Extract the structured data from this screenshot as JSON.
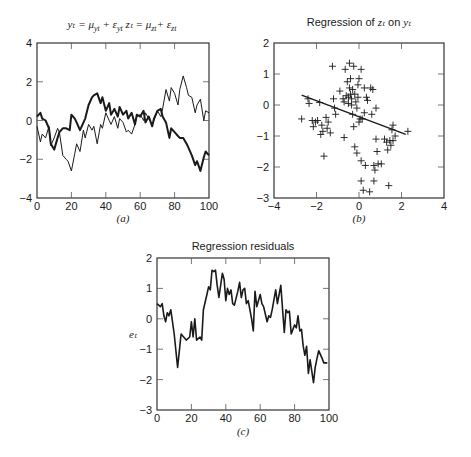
{
  "chart_data": [
    {
      "id": "a",
      "type": "line",
      "title": "y_t = μ_yt + ε_yt  z_t = μ_zt + ε_zt",
      "title_parts": {
        "y": "yₜ = μ",
        "ysub": "yt",
        "ymid": " + ε",
        "ysub2": "yt",
        "z": "  zₜ = μ",
        "zsub": "zt",
        "zmid": "+ ε",
        "zsub2": "zt"
      },
      "panel_label": "(a)",
      "xlabel": "",
      "ylabel": "",
      "xlim": [
        0,
        100
      ],
      "ylim": [
        -4,
        4
      ],
      "xticks": [
        "0",
        "20",
        "40",
        "60",
        "80",
        "100"
      ],
      "yticks": [
        "4",
        "2",
        "0",
        "−2",
        "−4"
      ],
      "grid": false,
      "series": [
        {
          "name": "y_t (thick)",
          "stroke_width": 2,
          "x": [
            0,
            2,
            3,
            5,
            7,
            8,
            10,
            12,
            13,
            15,
            17,
            19,
            20,
            22,
            23,
            25,
            26,
            28,
            30,
            32,
            33,
            35,
            37,
            38,
            40,
            42,
            43,
            45,
            47,
            48,
            50,
            52,
            53,
            55,
            57,
            58,
            60,
            62,
            63,
            65,
            67,
            68,
            70,
            72,
            73,
            75,
            77,
            78,
            80,
            82,
            83,
            85,
            87,
            88,
            90,
            92,
            93,
            95,
            97,
            98,
            100
          ],
          "values": [
            0.2,
            0.4,
            0.1,
            0.0,
            -0.4,
            -1.2,
            -1.5,
            -0.9,
            -0.6,
            -0.4,
            -0.4,
            -0.5,
            0.3,
            0.1,
            -0.1,
            -0.5,
            -0.3,
            0.1,
            0.8,
            1.2,
            1.3,
            1.4,
            0.9,
            1.2,
            0.5,
            0.9,
            0.3,
            0.6,
            0.2,
            0.7,
            0.3,
            0.5,
            0.1,
            0.4,
            -0.2,
            0.3,
            0.2,
            0.5,
            -0.1,
            0.2,
            -0.3,
            0.1,
            0.5,
            0.6,
            0.2,
            -0.1,
            -0.9,
            -0.4,
            -0.6,
            -0.8,
            -0.9,
            -0.9,
            -1.2,
            -1.4,
            -1.8,
            -2.3,
            -2.1,
            -2.6,
            -1.9,
            -1.6,
            -1.8
          ]
        },
        {
          "name": "z_t (thin)",
          "stroke_width": 1,
          "x": [
            0,
            2,
            3,
            5,
            7,
            8,
            10,
            12,
            13,
            15,
            17,
            18,
            20,
            22,
            23,
            25,
            27,
            28,
            30,
            32,
            33,
            35,
            37,
            38,
            40,
            42,
            43,
            45,
            47,
            48,
            50,
            52,
            53,
            55,
            57,
            58,
            60,
            62,
            63,
            65,
            67,
            68,
            70,
            72,
            73,
            75,
            77,
            78,
            80,
            82,
            83,
            85,
            87,
            88,
            90,
            92,
            93,
            95,
            97,
            98,
            100
          ],
          "values": [
            -0.3,
            -1.1,
            -0.7,
            -0.9,
            -0.3,
            -1.3,
            -0.9,
            -0.4,
            -0.6,
            -1.8,
            -2.0,
            -2.1,
            -2.6,
            -1.7,
            -1.2,
            -1.6,
            -0.5,
            -0.9,
            -0.2,
            -0.5,
            -0.3,
            -1.2,
            -0.2,
            -0.4,
            0.4,
            0.0,
            -0.2,
            0.2,
            -0.4,
            0.1,
            -0.1,
            -0.6,
            -0.5,
            -0.7,
            -0.2,
            0.2,
            0.3,
            0.0,
            0.4,
            0.1,
            -0.2,
            0.0,
            0.5,
            0.2,
            0.6,
            1.6,
            1.0,
            1.7,
            1.4,
            0.8,
            1.6,
            2.3,
            1.7,
            1.3,
            1.2,
            0.4,
            0.8,
            1.1,
            0.0,
            0.5,
            0.4
          ]
        }
      ]
    },
    {
      "id": "b",
      "type": "scatter",
      "title": "Regression of z_t on y_t",
      "title_parts": {
        "prefix": "Regression of ",
        "z": "zₜ",
        "mid": " on ",
        "y": "yₜ"
      },
      "panel_label": "(b)",
      "xlim": [
        -4,
        4
      ],
      "ylim": [
        -3,
        2
      ],
      "xticks": [
        "−4",
        "−2",
        "0",
        "2",
        "4"
      ],
      "yticks": [
        "2",
        "1",
        "0",
        "−1",
        "−2",
        "−3"
      ],
      "grid": false,
      "marker": "+",
      "points": [
        [
          -2.7,
          -0.45
        ],
        [
          -2.4,
          0.2
        ],
        [
          -2.35,
          0.05
        ],
        [
          -2.2,
          -0.5
        ],
        [
          -2.15,
          -0.7
        ],
        [
          -2.05,
          -0.55
        ],
        [
          -1.95,
          -0.5
        ],
        [
          -1.85,
          0.08
        ],
        [
          -1.8,
          -0.95
        ],
        [
          -1.75,
          -0.65
        ],
        [
          -1.7,
          -0.85
        ],
        [
          -1.65,
          -1.65
        ],
        [
          -1.55,
          -0.4
        ],
        [
          -1.5,
          -0.75
        ],
        [
          -1.45,
          -0.55
        ],
        [
          -1.35,
          -0.9
        ],
        [
          -1.25,
          1.25
        ],
        [
          -1.2,
          0.2
        ],
        [
          -1.15,
          -0.1
        ],
        [
          -1.1,
          -0.3
        ],
        [
          -0.9,
          0.45
        ],
        [
          -0.75,
          0.2
        ],
        [
          -0.7,
          0.1
        ],
        [
          -0.7,
          -1.05
        ],
        [
          -0.65,
          1.15
        ],
        [
          -0.6,
          0.3
        ],
        [
          -0.55,
          0.75
        ],
        [
          -0.5,
          0.05
        ],
        [
          -0.5,
          0.25
        ],
        [
          -0.45,
          1.35
        ],
        [
          -0.45,
          0.55
        ],
        [
          -0.4,
          0.85
        ],
        [
          -0.4,
          0.35
        ],
        [
          -0.35,
          0.2
        ],
        [
          -0.35,
          0.0
        ],
        [
          -0.3,
          0.5
        ],
        [
          -0.3,
          -0.3
        ],
        [
          -0.25,
          1.25
        ],
        [
          -0.25,
          -0.7
        ],
        [
          -0.2,
          0.35
        ],
        [
          -0.2,
          -1.35
        ],
        [
          -0.15,
          0.1
        ],
        [
          -0.1,
          -0.1
        ],
        [
          -0.1,
          -1.55
        ],
        [
          -0.05,
          0.65
        ],
        [
          -0.05,
          0.25
        ],
        [
          0.0,
          0.85
        ],
        [
          0.0,
          -0.55
        ],
        [
          0.05,
          -0.45
        ],
        [
          0.1,
          1.15
        ],
        [
          0.1,
          -1.8
        ],
        [
          0.1,
          -2.45
        ],
        [
          0.15,
          -0.45
        ],
        [
          0.2,
          -2.75
        ],
        [
          0.25,
          0.55
        ],
        [
          0.25,
          -0.25
        ],
        [
          0.3,
          -1.95
        ],
        [
          0.35,
          0.25
        ],
        [
          0.4,
          0.15
        ],
        [
          0.5,
          -2.8
        ],
        [
          0.55,
          0.55
        ],
        [
          0.6,
          -0.3
        ],
        [
          0.65,
          0.5
        ],
        [
          0.7,
          -1.95
        ],
        [
          0.7,
          -2.45
        ],
        [
          0.75,
          -2.1
        ],
        [
          0.8,
          -0.1
        ],
        [
          0.8,
          -1.1
        ],
        [
          0.85,
          -1.5
        ],
        [
          0.9,
          -1.9
        ],
        [
          1.05,
          -1.9
        ],
        [
          1.2,
          -1.1
        ],
        [
          1.3,
          -1.2
        ],
        [
          1.35,
          -1.45
        ],
        [
          1.4,
          -2.6
        ],
        [
          1.45,
          -1.15
        ],
        [
          1.5,
          -1.3
        ],
        [
          1.55,
          -0.8
        ],
        [
          1.6,
          -0.65
        ],
        [
          1.6,
          -1.15
        ],
        [
          1.7,
          -1.0
        ],
        [
          2.3,
          -0.85
        ]
      ],
      "fit_line": {
        "x": [
          -2.7,
          2.2
        ],
        "y": [
          0.32,
          -0.95
        ]
      }
    },
    {
      "id": "c",
      "type": "line",
      "title": "Regression residuals",
      "panel_label": "(c)",
      "ylabel": "e_t",
      "ylabel_display": "eₜ",
      "xlim": [
        0,
        100
      ],
      "ylim": [
        -3,
        2
      ],
      "xticks": [
        "0",
        "20",
        "40",
        "60",
        "80",
        "100"
      ],
      "yticks": [
        "2",
        "1",
        "0",
        "−1",
        "−2",
        "−3"
      ],
      "grid": false,
      "series": [
        {
          "name": "e_t",
          "stroke_width": 1.6,
          "x": [
            0,
            2,
            3,
            4,
            5,
            6,
            7,
            8,
            10,
            12,
            14,
            17,
            19,
            20,
            21,
            22,
            23,
            25,
            26,
            27,
            29,
            30,
            31,
            32,
            33,
            34,
            35,
            36,
            38,
            39,
            40,
            41,
            42,
            43,
            44,
            45,
            47,
            48,
            49,
            50,
            51,
            52,
            53,
            55,
            56,
            57,
            58,
            60,
            61,
            62,
            64,
            65,
            66,
            67,
            69,
            70,
            71,
            72,
            74,
            75,
            76,
            77,
            78,
            80,
            81,
            82,
            83,
            84,
            85,
            86,
            87,
            88,
            89,
            91,
            92,
            93,
            94,
            96,
            97,
            98,
            99
          ],
          "values": [
            0.5,
            0.4,
            0.5,
            0.1,
            -0.1,
            0.2,
            0.1,
            0.3,
            -0.5,
            -1.6,
            -0.5,
            -0.7,
            -0.6,
            -0.1,
            -0.6,
            0.0,
            -0.7,
            -0.6,
            -0.7,
            0.3,
            0.8,
            1.05,
            0.95,
            1.6,
            1.55,
            1.6,
            1.1,
            0.7,
            1.5,
            1.3,
            0.6,
            1.0,
            0.8,
            0.95,
            0.5,
            0.45,
            0.9,
            1.2,
            0.7,
            0.95,
            1.0,
            0.5,
            0.6,
            0.0,
            -0.4,
            0.9,
            0.4,
            0.8,
            0.5,
            0.4,
            -0.1,
            0.1,
            0.05,
            0.3,
            0.95,
            0.5,
            0.8,
            1.1,
            -0.45,
            0.3,
            0.2,
            0.25,
            -0.5,
            -0.2,
            -0.3,
            0.1,
            -0.4,
            -0.35,
            -0.9,
            -1.2,
            -0.9,
            -1.8,
            -1.35,
            -2.1,
            -1.6,
            -1.3,
            -1.05,
            -1.3,
            -1.45,
            -1.45,
            -1.45
          ]
        }
      ]
    }
  ],
  "colors": {
    "ink": "#1a1a1a",
    "background": "#ffffff",
    "frame": "#333333"
  }
}
